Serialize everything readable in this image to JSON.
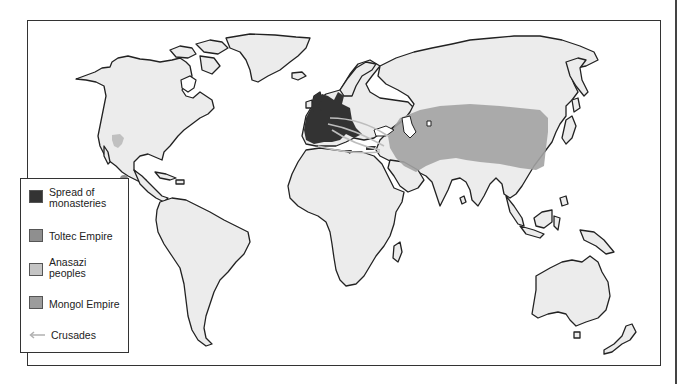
{
  "map": {
    "title": "World map, c. 1000-1300",
    "land_color": "#ececec",
    "ocean_color": "#ffffff",
    "regions": [
      {
        "name": "Spread of monasteries",
        "location": "Western Europe",
        "color": "#333333"
      },
      {
        "name": "Toltec Empire",
        "location": "Central Mexico",
        "color": "#8f8f8f"
      },
      {
        "name": "Anasazi peoples",
        "location": "Southwestern North America",
        "color": "#bdbdbd"
      },
      {
        "name": "Mongol Empire",
        "location": "Central and East Asia",
        "color": "#a6a6a6"
      },
      {
        "name": "Crusades",
        "location": "Europe to Levant",
        "color": "#bdbdbd"
      }
    ]
  },
  "legend": {
    "items": [
      {
        "label_line1": "Spread of",
        "label_line2": "monasteries",
        "color": "#333333",
        "icon": "swatch"
      },
      {
        "label_line1": "Toltec Empire",
        "label_line2": "",
        "color": "#8f8f8f",
        "icon": "swatch"
      },
      {
        "label_line1": "Anasazi",
        "label_line2": "peoples",
        "color": "#c4c4c4",
        "icon": "swatch"
      },
      {
        "label_line1": "Mongol Empire",
        "label_line2": "",
        "color": "#9c9c9c",
        "icon": "swatch"
      },
      {
        "label_line1": "Crusades",
        "label_line2": "",
        "color": "#b0b0b0",
        "icon": "arrow-left-icon"
      }
    ]
  }
}
